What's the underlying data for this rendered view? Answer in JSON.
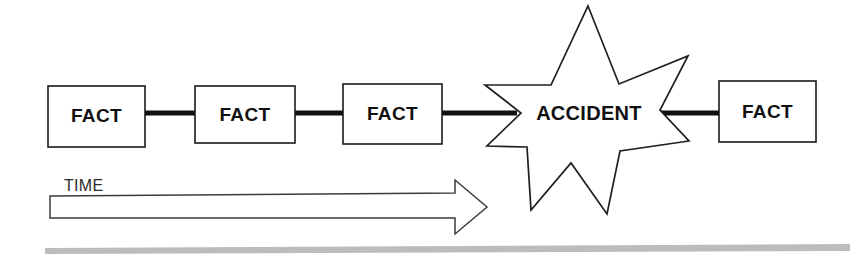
{
  "diagram": {
    "background_color": "#ffffff",
    "line_color": "#111111",
    "shape_fill": "#ffffff",
    "baseline_color": "#bcbcbc",
    "nodes": [
      {
        "id": "fact-1",
        "label": "FACT",
        "shape": "rectangle",
        "x": 48,
        "y": 86,
        "width": 97,
        "height": 61
      },
      {
        "id": "fact-2",
        "label": "FACT",
        "shape": "rectangle",
        "x": 195,
        "y": 86,
        "width": 100,
        "height": 57
      },
      {
        "id": "fact-3",
        "label": "FACT",
        "shape": "rectangle",
        "x": 343,
        "y": 84,
        "width": 99,
        "height": 60
      },
      {
        "id": "accident",
        "label": "ACCIDENT",
        "shape": "star-7-point",
        "x": 485,
        "y": 5,
        "width": 205,
        "height": 210
      },
      {
        "id": "fact-4",
        "label": "FACT",
        "shape": "rectangle",
        "x": 719,
        "y": 81,
        "width": 97,
        "height": 61
      }
    ],
    "connectors": [
      {
        "id": "link-1",
        "from": "fact-1",
        "to": "fact-2",
        "x1": 145,
        "x2": 196,
        "y": 113
      },
      {
        "id": "link-2",
        "from": "fact-2",
        "to": "fact-3",
        "x1": 295,
        "x2": 344,
        "y": 113
      },
      {
        "id": "link-3",
        "from": "fact-3",
        "to": "accident",
        "x1": 442,
        "x2": 515,
        "y": 113
      },
      {
        "id": "link-4",
        "from": "accident",
        "to": "fact-4",
        "x1": 660,
        "x2": 720,
        "y": 113
      }
    ],
    "time_axis": {
      "label": "TIME",
      "label_x": 64,
      "label_y": 191,
      "arrow_body_x": 50,
      "arrow_body_y": 196,
      "arrow_body_width": 405,
      "arrow_body_height": 22,
      "arrow_tip_x": 487,
      "arrow_head_top_y": 180,
      "arrow_head_bottom_y": 234,
      "direction": "right"
    },
    "baseline": {
      "x": 45,
      "y": 247,
      "width": 805,
      "height": 6
    }
  }
}
